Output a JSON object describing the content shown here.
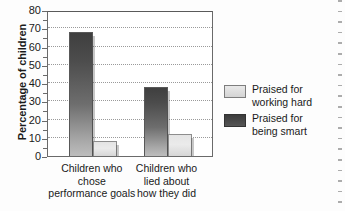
{
  "chart_data": {
    "type": "bar",
    "title": "",
    "xlabel": "",
    "ylabel": "Percentage of children",
    "ylim": [
      0,
      80
    ],
    "yticks": [
      0,
      10,
      20,
      30,
      40,
      50,
      60,
      70,
      80
    ],
    "grid": true,
    "legend_position": "right",
    "categories": [
      "Children who chose performance goals",
      "Children who lied about how they did"
    ],
    "category_lines": [
      [
        "Children who",
        "chose",
        "performance goals"
      ],
      [
        "Children who",
        "lied about",
        "how they did"
      ]
    ],
    "series": [
      {
        "name": "Praised for being smart",
        "values": [
          68,
          38
        ],
        "color": "#4c4c4c"
      },
      {
        "name": "Praised for working hard",
        "values": [
          8,
          12
        ],
        "color": "#e4e4e4"
      }
    ]
  },
  "legend": {
    "items": [
      {
        "label_line1": "Praised for",
        "label_line2": "working hard",
        "swatch": "light"
      },
      {
        "label_line1": "Praised for",
        "label_line2": "being smart",
        "swatch": "dark"
      }
    ]
  },
  "axis": {
    "y_title": "Percentage of children",
    "ticks": [
      "80",
      "70",
      "60",
      "50",
      "40",
      "30",
      "20",
      "10",
      "0"
    ]
  }
}
